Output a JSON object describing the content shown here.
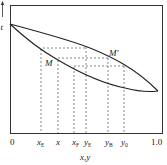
{
  "diagram": {
    "type": "temperature-composition phase diagram",
    "y_axis_label": "t",
    "x_axis_label": "x,y",
    "x_ticks": [
      {
        "id": "zero",
        "text": "0",
        "sub": ""
      },
      {
        "id": "xE",
        "text": "x",
        "sub": "E"
      },
      {
        "id": "x",
        "text": "x",
        "sub": ""
      },
      {
        "id": "xF",
        "text": "x",
        "sub": "F"
      },
      {
        "id": "yE",
        "text": "y",
        "sub": "E"
      },
      {
        "id": "yB",
        "text": "y",
        "sub": "B"
      },
      {
        "id": "y0",
        "text": "y",
        "sub": "0"
      },
      {
        "id": "one",
        "text": "1.0",
        "sub": ""
      }
    ],
    "points": {
      "M": "M",
      "M_prime": "M′"
    },
    "curves": [
      "vapor-line (upper)",
      "liquid-line (lower)"
    ],
    "tie_lines": 3
  }
}
